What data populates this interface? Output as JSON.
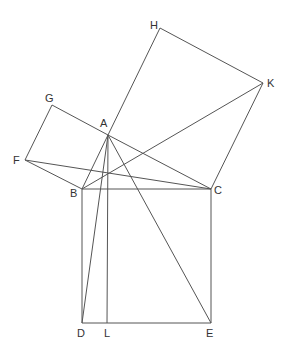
{
  "stroke_color": "#555555",
  "points": {
    "A": {
      "x": 108,
      "y": 135,
      "label": "A",
      "lx": 100,
      "ly": 118
    },
    "B": {
      "x": 82,
      "y": 189,
      "label": "B",
      "lx": 70,
      "ly": 188
    },
    "C": {
      "x": 211,
      "y": 189,
      "label": "C",
      "lx": 214,
      "ly": 185
    },
    "D": {
      "x": 82,
      "y": 323,
      "label": "D",
      "lx": 77,
      "ly": 328
    },
    "E": {
      "x": 211,
      "y": 323,
      "label": "E",
      "lx": 206,
      "ly": 328
    },
    "L": {
      "x": 107,
      "y": 323,
      "label": "L",
      "lx": 104,
      "ly": 328
    },
    "F": {
      "x": 25,
      "y": 160,
      "label": "F",
      "lx": 13,
      "ly": 155
    },
    "G": {
      "x": 52,
      "y": 105,
      "label": "G",
      "lx": 45,
      "ly": 93
    },
    "H": {
      "x": 160,
      "y": 28,
      "label": "H",
      "lx": 150,
      "ly": 20
    },
    "K": {
      "x": 263,
      "y": 83,
      "label": "K",
      "lx": 267,
      "ly": 78
    }
  },
  "segments": [
    [
      "A",
      "B"
    ],
    [
      "A",
      "C"
    ],
    [
      "B",
      "C"
    ],
    [
      "B",
      "D"
    ],
    [
      "D",
      "E"
    ],
    [
      "E",
      "C"
    ],
    [
      "A",
      "G"
    ],
    [
      "G",
      "F"
    ],
    [
      "F",
      "B"
    ],
    [
      "A",
      "H"
    ],
    [
      "H",
      "K"
    ],
    [
      "K",
      "C"
    ],
    [
      "A",
      "L"
    ],
    [
      "A",
      "D"
    ],
    [
      "A",
      "E"
    ],
    [
      "F",
      "C"
    ],
    [
      "B",
      "K"
    ]
  ]
}
